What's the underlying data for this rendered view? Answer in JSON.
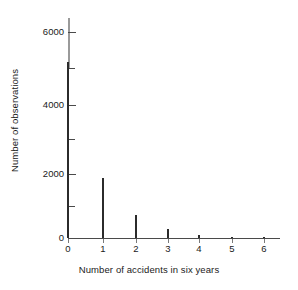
{
  "chart_data": {
    "type": "bar",
    "title": "",
    "xlabel": "Number of accidents in six years",
    "ylabel": "Number of observations",
    "categories": [
      "0",
      "1",
      "2",
      "3",
      "4",
      "5",
      "6"
    ],
    "values": [
      5280,
      1800,
      700,
      280,
      100,
      45,
      20
    ],
    "x": [
      0,
      1,
      2,
      3,
      4,
      5,
      6
    ],
    "xlim": [
      0,
      6.55
    ],
    "ylim": [
      0,
      6600
    ],
    "xticks": [
      "0",
      "1",
      "2",
      "3",
      "4",
      "5",
      "6"
    ],
    "yticks_major": [
      "0",
      "2000",
      "4000",
      "6000"
    ],
    "yticks_minor": [
      "1000",
      "3000",
      "5000"
    ],
    "grid": false,
    "legend": false,
    "legend_position": "none",
    "series": [
      {
        "name": "Number of observations",
        "values": [
          5280,
          1800,
          700,
          280,
          100,
          45,
          20
        ]
      }
    ],
    "bar_color": "#2b2b2b",
    "axis_color": "#4a4a4a",
    "background": "#ffffff"
  },
  "axes": {
    "y_tick_labels": [
      {
        "text": "6000",
        "value": 6000,
        "kind": "major"
      },
      {
        "text": "4000",
        "value": 4000,
        "kind": "major"
      },
      {
        "text": "2000",
        "value": 2000,
        "kind": "major"
      },
      {
        "text": "0",
        "value": 0,
        "kind": "major"
      }
    ],
    "y_minor_values": [
      5000,
      3000,
      1000
    ],
    "x_tick_labels": [
      {
        "text": "0",
        "value": 0
      },
      {
        "text": "1",
        "value": 1
      },
      {
        "text": "2",
        "value": 2
      },
      {
        "text": "3",
        "value": 3
      },
      {
        "text": "4",
        "value": 4
      },
      {
        "text": "5",
        "value": 5
      },
      {
        "text": "6",
        "value": 6
      }
    ],
    "xlabel": "Number of accidents in six years",
    "ylabel": "Number of observations"
  }
}
